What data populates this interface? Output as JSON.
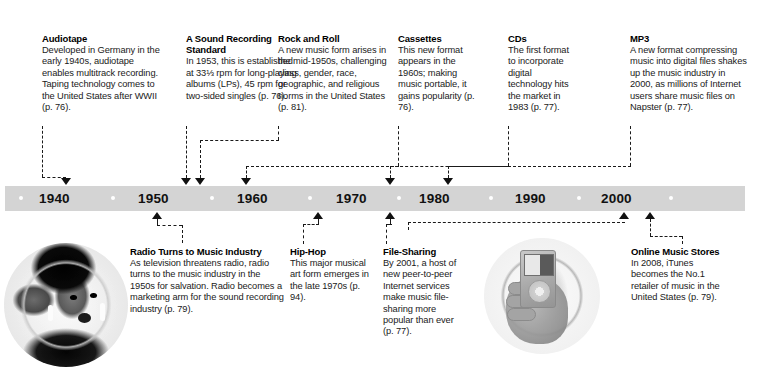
{
  "timeline": {
    "decades": [
      "1940",
      "1950",
      "1960",
      "1970",
      "1980",
      "1990",
      "2000"
    ],
    "bar_color": "#d4d4d4",
    "dot_color": "#ffffff"
  },
  "top_entries": [
    {
      "title": "Audiotape",
      "body": "Developed in Germany in the early 1940s, audiotape enables multitrack recording. Taping technology comes to the United States after WWII (p. 76)."
    },
    {
      "title": "A Sound Recording Standard",
      "body": "In 1953, this is established at 33⅓ rpm for long-playing albums (LPs), 45 rpm for two-sided singles (p. 76)."
    },
    {
      "title": "Rock and Roll",
      "body": "A new music form arises in the mid-1950s, challenging class, gender, race, geographic, and religious norms in the United States (p. 81)."
    },
    {
      "title": "Cassettes",
      "body": "This new format appears in the 1960s; making music portable, it gains popularity (p. 76)."
    },
    {
      "title": "CDs",
      "body": "The first format to incorporate digital technology hits the market in 1983 (p. 77)."
    },
    {
      "title": "MP3",
      "body": "A new format compressing music into digital files shakes up the music industry in 2000, as millions of Internet users share music files on Napster (p. 77)."
    }
  ],
  "bottom_entries": [
    {
      "title": "Radio Turns to Music Industry",
      "body": "As television threatens radio, radio turns to the music industry in the 1950s for salvation. Radio becomes a marketing arm for the sound recording industry (p. 79)."
    },
    {
      "title": "Hip-Hop",
      "body": "This major musical art form emerges in the late 1970s (p. 94)."
    },
    {
      "title": "File-Sharing",
      "body": "By 2001, a host of new peer-to-peer Internet services make music file-sharing more popular than ever (p. 77)."
    },
    {
      "title": "Online Music Stores",
      "body": "In 2008, iTunes becomes the No.1 retailer of music in the United States (p. 79)."
    }
  ],
  "photos": [
    {
      "name": "singer-photo",
      "caption": "black-and-white circular photograph of a singer performing"
    },
    {
      "name": "ipod-photo",
      "caption": "black-and-white circular photograph of a hand holding a portable MP3 player"
    }
  ]
}
